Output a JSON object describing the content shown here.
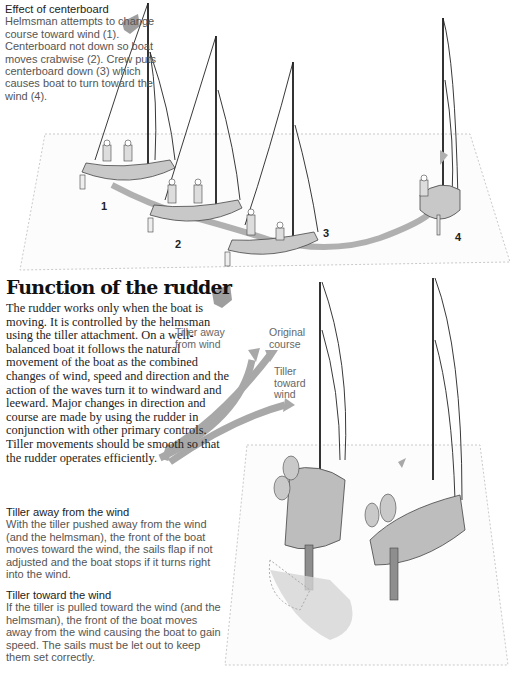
{
  "effect_caption": {
    "heading": "Effect of centerboard",
    "body": "Helmsman attempts to change course toward wind (1). Centerboard not down so boat moves crabwise (2). Crew puts centerboard down (3) which causes boat to turn toward the wind (4)."
  },
  "boat_numbers": [
    "1",
    "2",
    "3",
    "4"
  ],
  "rudder_section": {
    "title": "Function of the rudder",
    "intro": "The rudder works only when the boat is moving. It is controlled by the helmsman using the tiller attachment. On a well-balanced boat it follows the natural movement of the boat as the combined changes of wind, speed and direction and the action of the waves turn it to windward and leeward. Major changes in direction and course are made by using the rudder in conjunction with other primary controls. Tiller movements should be smooth so that the rudder operates efficiently."
  },
  "diagram_labels": {
    "tiller_away": "Tiller away from wind",
    "original_course": "Original course",
    "tiller_toward": "Tiller toward wind"
  },
  "subsections": [
    {
      "heading": "Tiller away from the wind",
      "body": "With the tiller pushed away from the wind (and the helmsman), the front of the boat moves toward the wind, the sails flap if not adjusted and the boat stops if it turns right into the wind."
    },
    {
      "heading": "Tiller toward the wind",
      "body": "If the tiller is pulled toward the wind (and the helmsman), the front of the boat moves away from the wind causing the boat to gain speed. The sails must be let out to keep them set correctly."
    }
  ],
  "colors": {
    "arrow_gray": "#a8a8a8",
    "text_dark": "#222222",
    "text_light": "#555555",
    "hull_gray": "#bdbdbd"
  }
}
